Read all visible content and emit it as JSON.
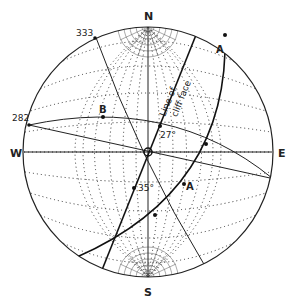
{
  "diagram": {
    "type": "stereographic projection (Wulff net)",
    "cardinals": {
      "north": "N",
      "south": "S",
      "east": "E",
      "west": "W"
    },
    "azimuth_labels": [
      {
        "id": "az-333",
        "text": "333"
      },
      {
        "id": "az-282",
        "text": "282"
      }
    ],
    "point_labels": [
      {
        "id": "point-a-top",
        "text": "A"
      },
      {
        "id": "point-a-lower",
        "text": "A"
      },
      {
        "id": "point-b",
        "text": "B"
      }
    ],
    "angle_labels": [
      {
        "id": "angle-27",
        "text": "27°"
      },
      {
        "id": "angle-35",
        "text": "35°"
      }
    ],
    "annotation": {
      "line1": "Line of",
      "line2": "cliff face"
    },
    "colors": {
      "ink": "#222222",
      "background": "#ffffff"
    }
  }
}
